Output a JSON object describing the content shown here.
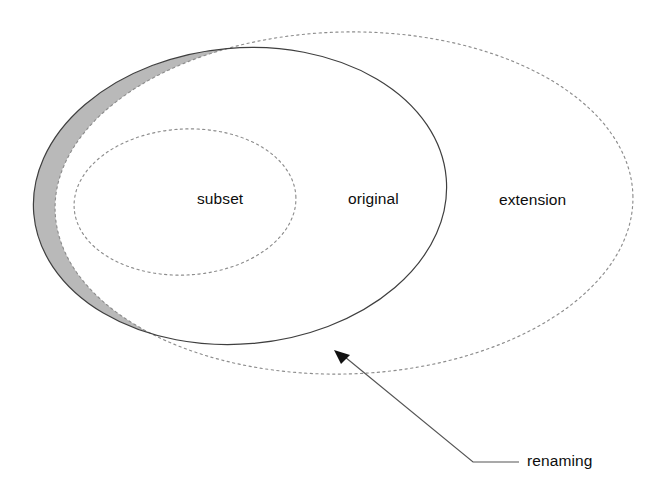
{
  "diagram": {
    "type": "venn-set-diagram",
    "background_color": "#ffffff",
    "regions": [
      {
        "id": "subset",
        "label": "subset",
        "shape": "ellipse",
        "stroke": "dotted",
        "stroke_color": "#808080",
        "fill": "none"
      },
      {
        "id": "original",
        "label": "original",
        "shape": "ellipse",
        "stroke": "solid",
        "stroke_color": "#3a3a3a",
        "fill": "none"
      },
      {
        "id": "extension",
        "label": "extension",
        "shape": "ellipse",
        "stroke": "dotted",
        "stroke_color": "#808080",
        "fill": "none"
      }
    ],
    "shaded_region": {
      "id": "renaming-crescent",
      "fill_color": "#b9b9b9",
      "description": "crescent between original and extension"
    },
    "annotation": {
      "label": "renaming",
      "leader_color": "#4a4a4a",
      "arrow_color": "#111111"
    }
  }
}
